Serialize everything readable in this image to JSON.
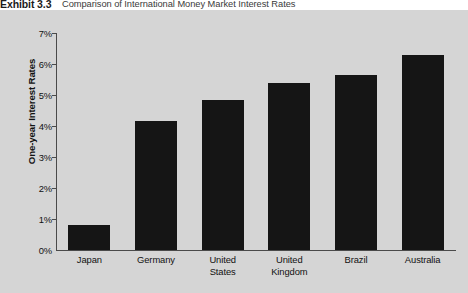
{
  "exhibit": {
    "number": "Exhibit 3.3",
    "caption": "Comparison of International Money Market Interest Rates"
  },
  "colors": {
    "panel_background": "#d5d5d5",
    "bar": "#151515",
    "axis": "#4a4a4a",
    "text": "#111111"
  },
  "chart_data": {
    "type": "bar",
    "title": "Comparison of International Money Market Interest Rates",
    "xlabel": "",
    "ylabel": "One-year Interest Rates",
    "categories": [
      "Japan",
      "United States",
      "Germany",
      "United Kingdom",
      "Brazil",
      "Australia"
    ],
    "bars": [
      {
        "category": "Japan",
        "line1": "Japan",
        "line2": "",
        "value": 0.8
      },
      {
        "category": "Germany",
        "line1": "Germany",
        "line2": "",
        "value": 4.15
      },
      {
        "category": "United States",
        "line1": "United",
        "line2": "States",
        "value": 4.85
      },
      {
        "category": "United Kingdom",
        "line1": "United",
        "line2": "Kingdom",
        "value": 5.4
      },
      {
        "category": "Brazil",
        "line1": "Brazil",
        "line2": "",
        "value": 5.65
      },
      {
        "category": "Australia",
        "line1": "Australia",
        "line2": "",
        "value": 6.3
      }
    ],
    "values": [
      0.8,
      4.15,
      4.85,
      5.4,
      5.65,
      6.3
    ],
    "ylim": [
      0,
      7
    ],
    "ytick_step": 1,
    "ytick_labels": [
      "7%",
      "6%",
      "5%",
      "4%",
      "3%",
      "2%",
      "1%",
      "0%"
    ],
    "ytick_values": [
      7,
      6,
      5,
      4,
      3,
      2,
      1,
      0
    ],
    "grid": false,
    "legend": "none",
    "value_unit": "%"
  }
}
